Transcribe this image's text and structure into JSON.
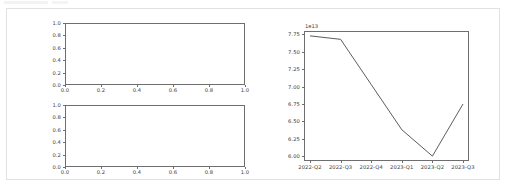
{
  "container": {
    "name": "notebook-output-cell"
  },
  "left_figure": {
    "name": "empty-subplots-figure",
    "subplots": [
      {
        "name": "upper-empty-axes",
        "yticks": [
          "0.0",
          "0.2",
          "0.4",
          "0.6",
          "0.8",
          "1.0"
        ],
        "xticks": [
          "0.0",
          "0.2",
          "0.4",
          "0.6",
          "0.8",
          "1.0"
        ]
      },
      {
        "name": "lower-empty-axes",
        "yticks": [
          "0.0",
          "0.2",
          "0.4",
          "0.6",
          "0.8",
          "1.0"
        ],
        "xticks": [
          "0.0",
          "0.2",
          "0.4",
          "0.6",
          "0.8",
          "1.0"
        ]
      }
    ]
  },
  "right_figure": {
    "name": "quarterly-line-chart",
    "exponent_label": "1e13",
    "line_color": "#4a4a4a"
  },
  "chart_data": {
    "type": "line",
    "title": "",
    "xlabel": "",
    "ylabel": "",
    "exponent": "1e13",
    "scale": 10000000000000.0,
    "categories": [
      "2022-Q2",
      "2022-Q3",
      "2022-Q4",
      "2023-Q1",
      "2023-Q2",
      "2023-Q3"
    ],
    "values": [
      7.73,
      7.68,
      7.03,
      6.38,
      6.0,
      6.75
    ],
    "values_absolute": [
      77300000000000.0,
      76800000000000.0,
      70300000000000.0,
      63800000000000.0,
      60000000000000.0,
      67500000000000.0
    ],
    "yticks": [
      "6.00",
      "6.25",
      "6.50",
      "6.75",
      "7.00",
      "7.25",
      "7.50",
      "7.75"
    ],
    "ytick_values": [
      6.0,
      6.25,
      6.5,
      6.75,
      7.0,
      7.25,
      7.5,
      7.75
    ],
    "ylim": [
      5.93,
      7.8
    ],
    "xticks": [
      "2022-Q2",
      "2022-Q3",
      "2022-Q4",
      "2023-Q1",
      "2023-Q2",
      "2023-Q3"
    ],
    "grid": false,
    "legend": null,
    "series": [
      {
        "name": "value",
        "values": [
          7.73,
          7.68,
          7.03,
          6.38,
          6.0,
          6.75
        ]
      }
    ]
  },
  "empty_chart_data": [
    {
      "type": "line",
      "title": "",
      "xlabel": "",
      "ylabel": "",
      "categories": [],
      "values": [],
      "xlim": [
        0.0,
        1.0
      ],
      "ylim": [
        0.0,
        1.0
      ],
      "xticks": [
        "0.0",
        "0.2",
        "0.4",
        "0.6",
        "0.8",
        "1.0"
      ],
      "yticks": [
        "0.0",
        "0.2",
        "0.4",
        "0.6",
        "0.8",
        "1.0"
      ],
      "grid": false
    },
    {
      "type": "line",
      "title": "",
      "xlabel": "",
      "ylabel": "",
      "categories": [],
      "values": [],
      "xlim": [
        0.0,
        1.0
      ],
      "ylim": [
        0.0,
        1.0
      ],
      "xticks": [
        "0.0",
        "0.2",
        "0.4",
        "0.6",
        "0.8",
        "1.0"
      ],
      "yticks": [
        "0.0",
        "0.2",
        "0.4",
        "0.6",
        "0.8",
        "1.0"
      ],
      "grid": false
    }
  ]
}
